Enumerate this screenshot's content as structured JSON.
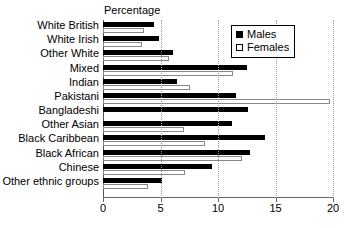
{
  "chart_data": {
    "type": "bar",
    "orientation": "horizontal",
    "title": "Percentage",
    "xlabel": "",
    "ylabel": "",
    "xlim": [
      0,
      20
    ],
    "xticks": [
      0,
      5,
      10,
      15,
      20
    ],
    "xtick_labels": [
      "0",
      "5",
      "10",
      "15",
      "20"
    ],
    "grid": true,
    "legend_position": "top-right",
    "categories": [
      "White British",
      "White Irish",
      "Other White",
      "Mixed",
      "Indian",
      "Pakistani",
      "Bangladeshi",
      "Other Asian",
      "Black Caribbean",
      "Black African",
      "Chinese",
      "Other ethnic groups"
    ],
    "series": [
      {
        "name": "Males",
        "color": "#000000",
        "values": [
          4.4,
          4.9,
          6.1,
          12.5,
          6.4,
          11.6,
          12.6,
          11.2,
          14.1,
          12.8,
          9.5,
          5.1
        ]
      },
      {
        "name": "Females",
        "color": "#ffffff",
        "values": [
          3.6,
          3.4,
          5.7,
          11.3,
          7.6,
          19.7,
          0.0,
          7.0,
          8.9,
          12.1,
          7.1,
          3.9
        ]
      }
    ]
  }
}
